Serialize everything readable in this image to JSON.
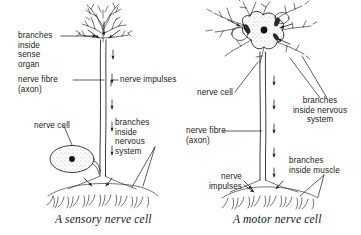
{
  "figure": {
    "title_present": false,
    "background_color": "#ffffff",
    "ink_color": "#1a1a1a"
  },
  "panels": [
    {
      "id": "sensory",
      "caption": "A sensory nerve cell",
      "labels": [
        {
          "name": "branches-inside-sense-organ",
          "lines": [
            "branches",
            "inside",
            "sense",
            "organ"
          ],
          "align": "left"
        },
        {
          "name": "nerve-fibre-axon",
          "lines": [
            "nerve fibre",
            "(axon)"
          ],
          "align": "left"
        },
        {
          "name": "nerve-impulses",
          "lines": [
            "nerve impulses"
          ],
          "align": "left"
        },
        {
          "name": "nerve-cell",
          "lines": [
            "nerve cell"
          ],
          "align": "left"
        },
        {
          "name": "branches-inside-nervous-system",
          "lines": [
            "branches",
            "inside",
            "nervous",
            "system"
          ],
          "align": "left"
        }
      ]
    },
    {
      "id": "motor",
      "caption": "A motor nerve cell",
      "labels": [
        {
          "name": "nerve-cell",
          "lines": [
            "nerve cell"
          ],
          "align": "left"
        },
        {
          "name": "branches-inside-nervous-system",
          "lines": [
            "branches",
            "inside nervous",
            "system"
          ],
          "align": "center"
        },
        {
          "name": "nerve-fibre-axon",
          "lines": [
            "nerve fibre",
            "(axon)"
          ],
          "align": "left"
        },
        {
          "name": "nerve-impulses",
          "lines": [
            "nerve",
            "impulses"
          ],
          "align": "right"
        },
        {
          "name": "branches-inside-muscle",
          "lines": [
            "branches",
            "inside muscle"
          ],
          "align": "left"
        }
      ]
    }
  ],
  "text": {
    "branches": "branches",
    "inside": "inside",
    "sense": "sense",
    "organ": "organ",
    "nerve_fibre": "nerve fibre",
    "axon": "(axon)",
    "nerve_impulses_one_line": "nerve impulses",
    "nerve_cell": "nerve cell",
    "nervous": "nervous",
    "system": "system",
    "inside_nervous": "inside nervous",
    "nerve": "nerve",
    "impulses": "impulses",
    "inside_muscle": "inside muscle",
    "caption_sensory": "A sensory nerve cell",
    "caption_motor": "A motor nerve cell"
  }
}
